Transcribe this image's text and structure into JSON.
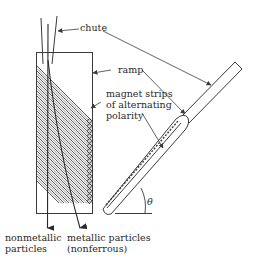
{
  "diagram": {
    "type": "schematic",
    "colors": {
      "line": "#3a3a3a",
      "text": "#2a2a2a",
      "background": "#ffffff"
    },
    "labels": {
      "chute": "chute",
      "ramp": "ramp",
      "magnet_line1": "magnet strips",
      "magnet_line2": "of alternating",
      "magnet_line3": "polarity",
      "nonmetallic_line1": "nonmetallic",
      "nonmetallic_line2": "particles",
      "metallic_line1": "metallic particles",
      "metallic_line2": "(nonferrous)",
      "angle": "θ"
    },
    "components": [
      {
        "id": "chute",
        "label": "chute",
        "description": "feed chute drawn twice: vertical in front view, inclined in side view"
      },
      {
        "id": "ramp",
        "label": "ramp",
        "description": "rectangular ramp plate in front view, inclined ramp in side view"
      },
      {
        "id": "magnet-strips",
        "label": "magnet strips of alternating polarity",
        "description": "diagonal hatched strips on ramp"
      },
      {
        "id": "nonmetallic-path",
        "label": "nonmetallic particles",
        "description": "vertical downward trajectory"
      },
      {
        "id": "metallic-path",
        "label": "metallic particles (nonferrous)",
        "description": "deflected downward trajectory"
      },
      {
        "id": "incline-angle",
        "label": "θ",
        "description": "ramp inclination angle from horizontal"
      }
    ]
  }
}
